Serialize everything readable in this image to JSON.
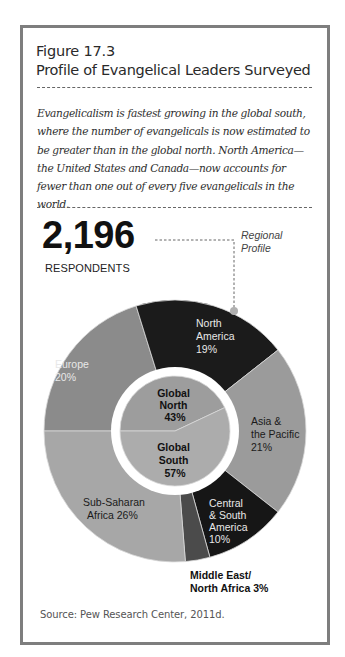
{
  "figure": {
    "number": "Figure 17.3",
    "title": "Profile of Evangelical Leaders Surveyed",
    "caption": "Evangelicalism is fastest growing in the global south, where the number of evangelicals is now estimated to be greater than in the global north. North America—the United States and Canada—now accounts for fewer than one out of every five evangelicals in the world.",
    "respondents_count": "2,196",
    "respondents_label": "RESPONDENTS",
    "callout_label_line1": "Regional",
    "callout_label_line2": "Profile",
    "source": "Source:  Pew Research Center, 2011d."
  },
  "colors": {
    "frame": "#7e7e7e",
    "europe": "#8b8b8b",
    "north_america": "#1b1b1b",
    "asia_pacific": "#9b9b9b",
    "central_south_america": "#161616",
    "middle_east_north_africa": "#4b4b4b",
    "sub_saharan_africa": "#a7a7a7",
    "global_north": "#9d9d9d",
    "global_south": "#acacac"
  },
  "labels": {
    "europe": [
      "Europe",
      "20%"
    ],
    "north_america": [
      "North",
      "America",
      "19%"
    ],
    "asia_pacific": [
      "Asia &",
      "the Pacific",
      "21%"
    ],
    "central_south_america": [
      "Central",
      "& South",
      "America",
      "10%"
    ],
    "middle_east_north_africa": [
      "Middle East/",
      "North Africa 3%"
    ],
    "sub_saharan_africa": [
      "Sub-Saharan",
      "Africa 26%"
    ],
    "global_north": [
      "Global",
      "North",
      "43%"
    ],
    "global_south": [
      "Global",
      "South",
      "57%"
    ]
  },
  "chart_data": {
    "type": "pie",
    "title": "Profile of Evangelical Leaders Surveyed",
    "subtitle": "2,196 RESPONDENTS",
    "annotation": "Regional Profile",
    "series": [
      {
        "name": "Regional Profile (outer ring)",
        "categories": [
          "Europe",
          "North America",
          "Asia & the Pacific",
          "Central & South America",
          "Middle East/North Africa",
          "Sub-Saharan Africa"
        ],
        "values": [
          20,
          19,
          21,
          10,
          3,
          26
        ]
      },
      {
        "name": "Global North/South (inner circle)",
        "categories": [
          "Global North",
          "Global South"
        ],
        "values": [
          43,
          57
        ]
      }
    ],
    "units": "%",
    "source": "Pew Research Center, 2011d."
  }
}
